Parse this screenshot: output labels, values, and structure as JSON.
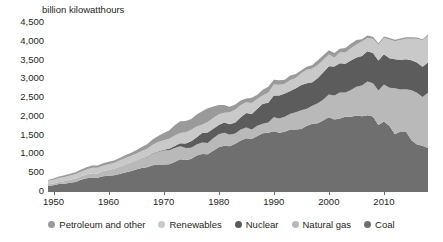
{
  "chart_data": {
    "type": "area",
    "stacked": true,
    "title": "",
    "subtitle": "",
    "xlabel": "",
    "ylabel": "billion kilowatthours",
    "grid": false,
    "legend_position": "bottom",
    "xlim": [
      1949,
      2018
    ],
    "ylim": [
      0,
      4500
    ],
    "y_ticks": [
      0,
      500,
      1000,
      1500,
      2000,
      2500,
      3000,
      3500,
      4000,
      4500
    ],
    "y_tick_labels": [
      "0",
      "500",
      "1,000",
      "1,500",
      "2,000",
      "2,500",
      "3,000",
      "3,500",
      "4,000",
      "4,500"
    ],
    "x_ticks": [
      1950,
      1960,
      1970,
      1980,
      1990,
      2000,
      2010
    ],
    "x_tick_labels": [
      "1950",
      "1960",
      "1970",
      "1980",
      "1990",
      "2000",
      "2010"
    ],
    "stack_order_bottom_to_top": [
      "Coal",
      "Natural gas",
      "Nuclear",
      "Renewables",
      "Petroleum and other"
    ],
    "x": [
      1949,
      1950,
      1951,
      1952,
      1953,
      1954,
      1955,
      1956,
      1957,
      1958,
      1959,
      1960,
      1961,
      1962,
      1963,
      1964,
      1965,
      1966,
      1967,
      1968,
      1969,
      1970,
      1971,
      1972,
      1973,
      1974,
      1975,
      1976,
      1977,
      1978,
      1979,
      1980,
      1981,
      1982,
      1983,
      1984,
      1985,
      1986,
      1987,
      1988,
      1989,
      1990,
      1991,
      1992,
      1993,
      1994,
      1995,
      1996,
      1997,
      1998,
      1999,
      2000,
      2001,
      2002,
      2003,
      2004,
      2005,
      2006,
      2007,
      2008,
      2009,
      2010,
      2011,
      2012,
      2013,
      2014,
      2015,
      2016,
      2017,
      2018
    ],
    "series": [
      {
        "name": "Coal",
        "color": "#6f6f6f",
        "values": [
          135,
          155,
          185,
          195,
          220,
          240,
          300,
          340,
          360,
          350,
          395,
          403,
          422,
          450,
          494,
          526,
          571,
          613,
          631,
          685,
          706,
          704,
          713,
          771,
          848,
          828,
          853,
          944,
          985,
          976,
          1075,
          1162,
          1203,
          1192,
          1259,
          1342,
          1402,
          1386,
          1464,
          1541,
          1554,
          1594,
          1551,
          1576,
          1639,
          1635,
          1653,
          1737,
          1788,
          1807,
          1881,
          1966,
          1904,
          1933,
          1974,
          1978,
          2013,
          1991,
          2016,
          1986,
          1756,
          1848,
          1733,
          1514,
          1581,
          1582,
          1352,
          1239,
          1206,
          1146
        ]
      },
      {
        "name": "Natural gas",
        "color": "#b9b9b9",
        "values": [
          45,
          45,
          57,
          65,
          79,
          94,
          95,
          104,
          114,
          119,
          139,
          158,
          169,
          184,
          202,
          220,
          222,
          250,
          263,
          306,
          333,
          373,
          374,
          376,
          341,
          320,
          300,
          295,
          306,
          305,
          329,
          346,
          346,
          305,
          274,
          297,
          292,
          249,
          273,
          253,
          267,
          373,
          382,
          404,
          415,
          460,
          496,
          455,
          479,
          531,
          556,
          601,
          639,
          691,
          650,
          710,
          761,
          816,
          897,
          883,
          921,
          988,
          1013,
          1225,
          1124,
          1126,
          1333,
          1378,
          1296,
          1468
        ]
      },
      {
        "name": "Nuclear",
        "color": "#5c5c5c",
        "values": [
          0,
          0,
          0,
          0,
          0,
          0,
          0,
          0,
          0,
          0,
          0,
          1,
          2,
          2,
          3,
          3,
          4,
          6,
          8,
          13,
          14,
          22,
          38,
          54,
          83,
          114,
          173,
          191,
          251,
          276,
          255,
          251,
          273,
          283,
          294,
          328,
          384,
          414,
          455,
          527,
          529,
          577,
          613,
          619,
          610,
          640,
          673,
          675,
          629,
          674,
          728,
          754,
          769,
          780,
          764,
          789,
          782,
          787,
          806,
          806,
          799,
          807,
          790,
          769,
          789,
          797,
          797,
          806,
          805,
          807
        ]
      },
      {
        "name": "Renewables",
        "color": "#c9c9c9",
        "values": [
          91,
          101,
          105,
          113,
          113,
          111,
          117,
          127,
          146,
          148,
          141,
          150,
          154,
          174,
          172,
          181,
          197,
          196,
          223,
          226,
          253,
          251,
          269,
          276,
          272,
          304,
          303,
          286,
          223,
          283,
          285,
          282,
          263,
          314,
          334,
          323,
          288,
          297,
          256,
          228,
          268,
          294,
          285,
          260,
          293,
          274,
          316,
          363,
          364,
          340,
          328,
          315,
          236,
          290,
          303,
          322,
          345,
          385,
          353,
          382,
          417,
          428,
          500,
          482,
          528,
          548,
          575,
          634,
          704,
          713
        ]
      },
      {
        "name": "Petroleum and other",
        "color": "#9a9a9a",
        "values": [
          20,
          34,
          40,
          44,
          50,
          54,
          58,
          62,
          62,
          61,
          65,
          66,
          67,
          71,
          78,
          83,
          92,
          104,
          118,
          139,
          161,
          196,
          219,
          274,
          314,
          301,
          289,
          320,
          358,
          365,
          304,
          246,
          206,
          147,
          144,
          120,
          100,
          137,
          118,
          149,
          158,
          126,
          118,
          101,
          121,
          105,
          79,
          81,
          92,
          129,
          119,
          112,
          125,
          95,
          119,
          121,
          122,
          64,
          66,
          47,
          44,
          42,
          38,
          36,
          38,
          40,
          37,
          32,
          33,
          32
        ]
      }
    ],
    "notes": {
      "peak_total_value": 4157,
      "peak_total_year": 2007,
      "coal_peak_value": 2016,
      "coal_peak_year": 2007
    }
  },
  "legend": {
    "items": [
      {
        "label": "Petroleum and other",
        "color": "#9a9a9a"
      },
      {
        "label": "Renewables",
        "color": "#c9c9c9"
      },
      {
        "label": "Nuclear",
        "color": "#5c5c5c"
      },
      {
        "label": "Natural gas",
        "color": "#b9b9b9"
      },
      {
        "label": "Coal",
        "color": "#6f6f6f"
      }
    ]
  },
  "colors": {
    "axis": "#6d6e71",
    "text": "#231f20",
    "background": "#ffffff"
  }
}
